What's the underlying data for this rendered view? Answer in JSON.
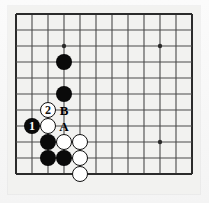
{
  "diagram": {
    "kind": "go-board-diagram",
    "board": {
      "columns": 12,
      "rows": 11,
      "origin_x": 8,
      "origin_y": 8,
      "cell": 16,
      "line_color": "#4a4a4a",
      "edge_color": "#2b2b2b",
      "background_color": "#f2f2f0",
      "line_width": 1.1,
      "edge_width": 2.0,
      "star_point_radius": 2.2,
      "star_points": [
        {
          "col": 3,
          "row": 2
        },
        {
          "col": 9,
          "row": 2
        },
        {
          "col": 9,
          "row": 8
        }
      ]
    },
    "stone_radius": 8.2,
    "stones": [
      {
        "id": "b-c3r3",
        "color": "black",
        "col": 3,
        "row": 3,
        "label": ""
      },
      {
        "id": "b-c3r5",
        "color": "black",
        "col": 3,
        "row": 5,
        "label": ""
      },
      {
        "id": "w-move2",
        "color": "white",
        "col": 2,
        "row": 6,
        "label": "2"
      },
      {
        "id": "w-c2r7",
        "color": "white",
        "col": 2,
        "row": 7,
        "label": ""
      },
      {
        "id": "b-move1",
        "color": "black",
        "col": 1,
        "row": 7,
        "label": "1"
      },
      {
        "id": "b-c2r8",
        "color": "black",
        "col": 2,
        "row": 8,
        "label": ""
      },
      {
        "id": "w-c3r8",
        "color": "white",
        "col": 3,
        "row": 8,
        "label": ""
      },
      {
        "id": "w-c4r8",
        "color": "white",
        "col": 4,
        "row": 8,
        "label": ""
      },
      {
        "id": "b-c2r9",
        "color": "black",
        "col": 2,
        "row": 9,
        "label": ""
      },
      {
        "id": "b-c3r9",
        "color": "black",
        "col": 3,
        "row": 9,
        "label": ""
      },
      {
        "id": "w-c4r9",
        "color": "white",
        "col": 4,
        "row": 9,
        "label": ""
      },
      {
        "id": "w-c4r10",
        "color": "white",
        "col": 4,
        "row": 10,
        "label": ""
      }
    ],
    "move_labels": [
      {
        "stone_id": "b-move1",
        "text": "1",
        "on": "black"
      },
      {
        "stone_id": "w-move2",
        "text": "2",
        "on": "white"
      }
    ],
    "point_letters": [
      {
        "id": "letter-b",
        "text": "B",
        "col": 3,
        "row": 6
      },
      {
        "id": "letter-a",
        "text": "A",
        "col": 3,
        "row": 7
      }
    ]
  }
}
